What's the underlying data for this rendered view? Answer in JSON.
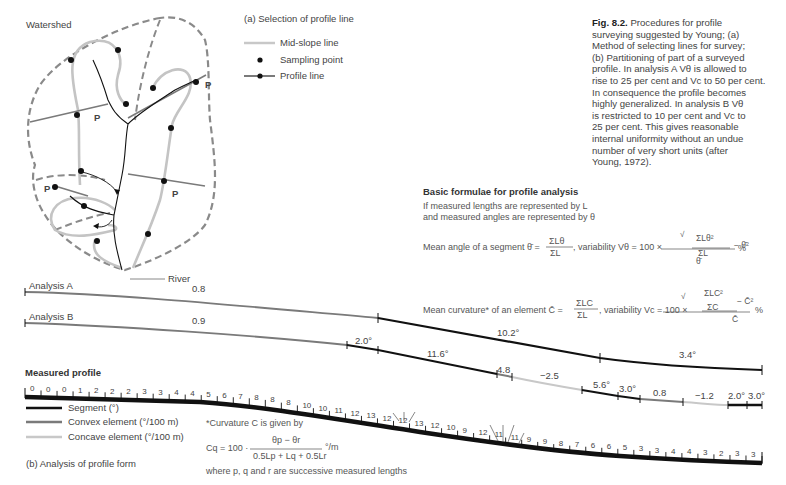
{
  "figure": {
    "caption_title": "Fig. 8.2.",
    "caption_lines": [
      "Procedures for profile",
      "surveying suggested by Young; (a)",
      "Method of selecting lines for survey;",
      "(b) Partitioning of part of a surveyed",
      "profile. In analysis A Vθ  is allowed to",
      "rise to 25 per cent and Vc  to 50 per cent.",
      "In consequence the profile becomes",
      "highly generalized. In analysis B Vθ",
      "is restricted to 10 per cent and Vc  to",
      "25 per cent. This gives reasonable",
      "internal uniformity without an undue",
      "number of very short units (after",
      "Young, 1972)."
    ]
  },
  "map": {
    "watershed_label": "Watershed",
    "river_label": "River",
    "profile_marker": "P",
    "legend_title": "(a) Selection of profile line",
    "legend": [
      {
        "symbol": "mid-slope-line",
        "label": "Mid-slope line"
      },
      {
        "symbol": "sampling-point",
        "label": "Sampling point"
      },
      {
        "symbol": "profile-line",
        "label": "Profile line"
      }
    ]
  },
  "formulae": {
    "title": "Basic formulae for profile analysis",
    "intro_1": "If measured lengths are represented by L",
    "intro_2": "and measured angles are represented by θ",
    "mean_angle_prefix": "Mean angle of a segment θ̄ =",
    "mean_angle_num": "ΣLθ",
    "mean_angle_den": "ΣL",
    "mean_angle_var": ", variability Vθ = 100 ×",
    "mean_angle_root_num": "ΣLθ²",
    "mean_angle_root_den": "ΣL",
    "mean_angle_minus": "− θ̄²",
    "mean_angle_bottom": "θ̄",
    "percent": "%",
    "mean_curv_prefix": "Mean curvature* of an element C̄ =",
    "mean_curv_num": "ΣLC",
    "mean_curv_den": "ΣL",
    "mean_curv_var": ", variability Vc = 100 ×",
    "mean_curv_root_num": "ΣLC²",
    "mean_curv_root_den": "ΣC",
    "mean_curv_minus": "− C̄²",
    "mean_curv_bottom": "C̄",
    "curvature_note": "*Curvature C is given by",
    "cq_prefix": "Cq = 100 ·",
    "cq_num": "θp − θr",
    "cq_den": "0.5Lp + Lq + 0.5Lr",
    "cq_unit": "°/m",
    "where_text": "where p, q and r are successive measured lengths"
  },
  "profile": {
    "analysis_a_label": "Analysis A",
    "analysis_b_label": "Analysis B",
    "analysis_a_values": [
      "0.8",
      "10.2°",
      "3.4°"
    ],
    "analysis_b_values": [
      "0.9",
      "2.0°",
      "11.6°",
      "4.8",
      "−2.5",
      "5.6°",
      "3.0°",
      "0.8",
      "−1.2",
      "2.0°",
      "3.0°"
    ],
    "measured_title": "Measured profile",
    "measured_values": [
      "0",
      "0",
      "0",
      "1",
      "2",
      "2",
      "2",
      "3",
      "3",
      "4",
      "4",
      "5",
      "6",
      "7",
      "8",
      "8",
      "8",
      "10",
      "10",
      "11",
      "12",
      "13",
      "12",
      "12",
      "13",
      "12",
      "10",
      "9",
      "12",
      "11",
      "11",
      "9",
      "9",
      "8",
      "7",
      "6",
      "6",
      "5",
      "3",
      "3",
      "4",
      "4",
      "3",
      "2",
      "3",
      "3"
    ],
    "legend": [
      {
        "symbol": "segment",
        "label": "Segment (°)"
      },
      {
        "symbol": "convex",
        "label": "Convex element (°/100 m)"
      },
      {
        "symbol": "concave",
        "label": "Concave element (°/100 m)"
      }
    ],
    "subtitle": "(b) Analysis of profile form"
  },
  "colors": {
    "segment": "#111111",
    "convex": "#7a7a7a",
    "concave": "#c8c8c8",
    "watershed": "#8a8a8a",
    "midslope": "#c4c4c4"
  }
}
